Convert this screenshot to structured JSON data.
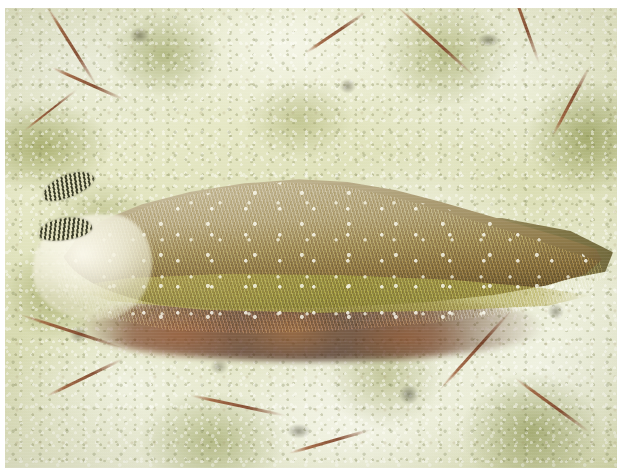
{
  "image": {
    "type": "photograph",
    "domain": "Natural-Image",
    "width": 620,
    "height": 468,
    "subject": "sea slug (sea hare / sacoglossan) on coral rubble",
    "orientation": "landscape",
    "border": {
      "color": "#ffffff",
      "top_px": 8,
      "left_px": 5,
      "right_px": 3,
      "bottom_px": 0
    }
  },
  "scene": {
    "background_name": "coral-rubble-substrate",
    "background_description": "mottled cream and pale-green calcareous coral rubble with olive algal patches and fine reddish-brown branching algal filaments",
    "lighting": "diffuse underwater light from above",
    "focus": "shallow depth of field, soft edges"
  },
  "palette": {
    "rubble_light": "#e8ead2",
    "rubble_mid": "#dcdfb8",
    "rubble_shadow": "#d6daac",
    "algae_olive": "#8e9a4a",
    "algae_red_brown": "#7c4024",
    "slug_dorsum_pale": "#c3b794",
    "slug_body_olive": "#9c8b5e",
    "slug_flank_dark": "#5c4a26",
    "slug_margin_yellow": "#a8a04e",
    "slug_head_cream": "#fcfaee",
    "rhinophore_dark": "#262814",
    "under_shadow": "#3a1a10",
    "speckle_white": "#fffff6"
  },
  "subject_parts": [
    {
      "name": "rhinophore-upper",
      "label": "Upper rhinophore",
      "description": "dark-banded tentacle angled up-left"
    },
    {
      "name": "rhinophore-lower",
      "label": "Lower rhinophore",
      "description": "dark-banded tentacle angled left"
    },
    {
      "name": "head",
      "label": "Head / oral veil",
      "description": "pale translucent cream region at the left end"
    },
    {
      "name": "mantle",
      "label": "Mantle / dorsum",
      "description": "elongate humped body with fine radiating striations, tan above grading to olive-brown below"
    },
    {
      "name": "parapodial-margin",
      "label": "Parapodial margin",
      "description": "olive-yellow ridge running along the lower flank"
    },
    {
      "name": "speckles",
      "label": "White speckles",
      "description": "scattered small white dots over the body surface"
    },
    {
      "name": "tail",
      "label": "Tail",
      "description": "tapering posterior end reaching toward the right edge"
    },
    {
      "name": "foot-shadow",
      "label": "Foot and shadow",
      "description": "dark red-brown shaded zone beneath the animal"
    }
  ],
  "background_elements": [
    {
      "name": "algal-filament-top-left",
      "description": "reddish branching filament in the upper-left rubble"
    },
    {
      "name": "algal-filament-top-right",
      "description": "reddish filament arcs in the upper-right rubble"
    },
    {
      "name": "algal-filament-lower-left",
      "description": "red-brown filaments across the lower-left rubble"
    },
    {
      "name": "algal-filament-lower-right",
      "description": "red-brown filaments across the lower-right rubble"
    },
    {
      "name": "rubble-pits",
      "description": "small dark pits and crevices in the coral surface"
    }
  ]
}
